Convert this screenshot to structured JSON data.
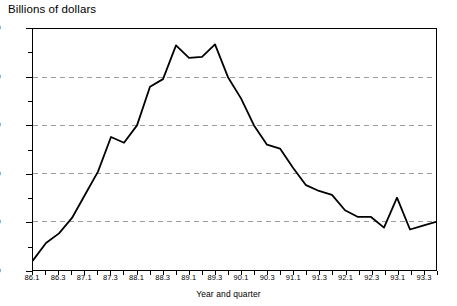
{
  "chart_data": {
    "type": "line",
    "title": "Billions of dollars",
    "xlabel": "Year and quarter",
    "ylabel": "",
    "ylim": [
      -50,
      200
    ],
    "xlim": [
      "86.1",
      "93.4"
    ],
    "grid": true,
    "grid_values": [
      150,
      100,
      50,
      0
    ],
    "legend": "none",
    "y_ticks": [
      {
        "value": 200,
        "label": "00"
      },
      {
        "value": 150,
        "label": "50"
      },
      {
        "value": 100,
        "label": "00"
      },
      {
        "value": 50,
        "label": "50"
      },
      {
        "value": 0,
        "label": "00"
      },
      {
        "value": -50,
        "label": "50"
      }
    ],
    "y_minor_ticks": [
      175,
      125,
      75,
      25,
      -25
    ],
    "x_tick_labels": [
      "86.1",
      "86.3",
      "87.1",
      "87.3",
      "88.1",
      "88.3",
      "89.1",
      "89.3",
      "90.1",
      "90.3",
      "91.1",
      "91.3",
      "92.1",
      "92.3",
      "93.1",
      "93.3"
    ],
    "x": [
      "86.1",
      "86.2",
      "86.3",
      "86.4",
      "87.1",
      "87.2",
      "87.3",
      "87.4",
      "88.1",
      "88.2",
      "88.3",
      "88.4",
      "89.1",
      "89.2",
      "89.3",
      "89.4",
      "90.1",
      "90.2",
      "90.3",
      "90.4",
      "91.1",
      "91.2",
      "91.3",
      "91.4",
      "92.1",
      "92.2",
      "92.3",
      "92.4",
      "93.1",
      "93.2",
      "93.3",
      "93.4"
    ],
    "values": [
      -40,
      -22,
      -12,
      4,
      28,
      52,
      88,
      82,
      100,
      140,
      148,
      183,
      170,
      171,
      184,
      150,
      128,
      100,
      80,
      76,
      56,
      38,
      32,
      28,
      12,
      5,
      5,
      -6,
      25,
      -8,
      -4,
      0
    ],
    "series": [
      {
        "name": "series-1",
        "color": "#000000",
        "values": [
          -40,
          -22,
          -12,
          4,
          28,
          52,
          88,
          82,
          100,
          140,
          148,
          183,
          170,
          171,
          184,
          150,
          128,
          100,
          80,
          76,
          56,
          38,
          32,
          28,
          12,
          5,
          5,
          -6,
          25,
          -8,
          -4,
          0
        ]
      }
    ]
  },
  "style": {
    "line_color": "#000000",
    "grid_color": "#9a9a9a",
    "frame_color": "#000000",
    "background": "#ffffff"
  }
}
